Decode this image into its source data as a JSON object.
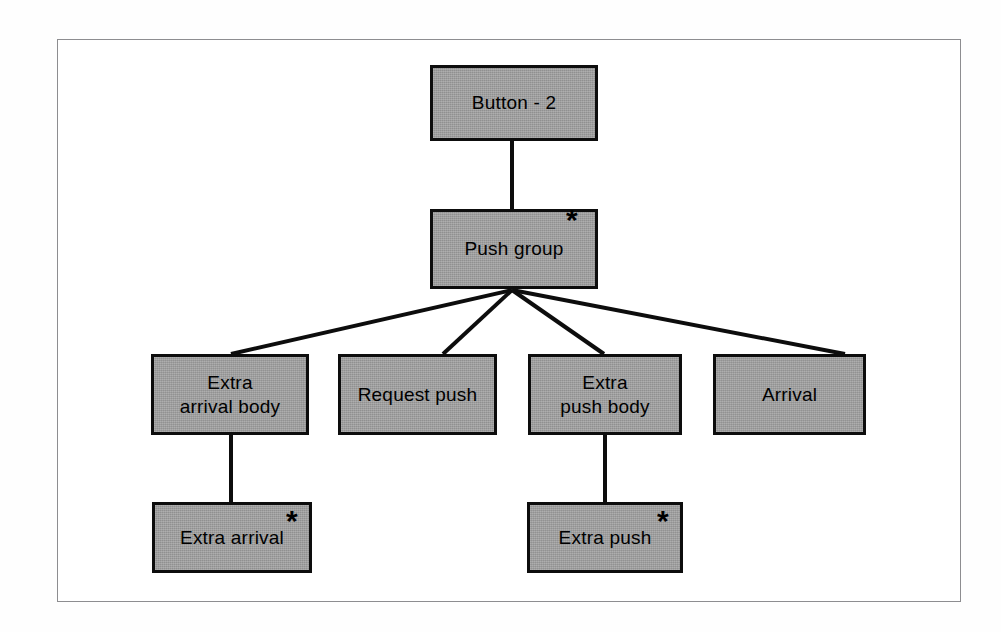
{
  "diagram": {
    "type": "tree-hierarchy",
    "marker_glyph": "*",
    "colors": {
      "node_fill": "#9d9d9d",
      "node_border": "#0d0d0d",
      "edge": "#0d0d0d",
      "text": "#000000",
      "page_frame": "#8d8d90",
      "background": "#ffffff"
    },
    "nodes": [
      {
        "id": "button-2",
        "label": "Button - 2",
        "marker": "",
        "marker_position": ""
      },
      {
        "id": "push-group",
        "label": "Push group",
        "marker": "*",
        "marker_position": "top-right-outside"
      },
      {
        "id": "extra-arrival-body",
        "label": "Extra\narrival body",
        "marker": "",
        "marker_position": ""
      },
      {
        "id": "request-push",
        "label": "Request push",
        "marker": "",
        "marker_position": ""
      },
      {
        "id": "extra-push-body",
        "label": "Extra\npush body",
        "marker": "",
        "marker_position": ""
      },
      {
        "id": "arrival",
        "label": "Arrival",
        "marker": "",
        "marker_position": ""
      },
      {
        "id": "extra-arrival",
        "label": "Extra arrival",
        "marker": "*",
        "marker_position": "top-right-inside"
      },
      {
        "id": "extra-push",
        "label": "Extra push",
        "marker": "*",
        "marker_position": "top-right-inside"
      }
    ],
    "edges": [
      {
        "from": "button-2",
        "to": "push-group",
        "style": "vertical"
      },
      {
        "from": "push-group",
        "to": "extra-arrival-body",
        "style": "diagonal"
      },
      {
        "from": "push-group",
        "to": "request-push",
        "style": "diagonal"
      },
      {
        "from": "push-group",
        "to": "extra-push-body",
        "style": "diagonal"
      },
      {
        "from": "push-group",
        "to": "arrival",
        "style": "diagonal"
      },
      {
        "from": "extra-arrival-body",
        "to": "extra-arrival",
        "style": "vertical"
      },
      {
        "from": "extra-push-body",
        "to": "extra-push",
        "style": "vertical"
      }
    ]
  }
}
